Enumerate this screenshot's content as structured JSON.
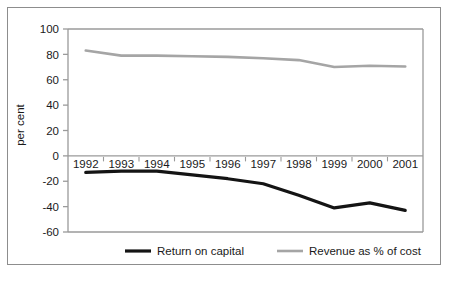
{
  "figure": {
    "ylabel": "per cent",
    "frame_color": "#8d8d8d",
    "background": "#ffffff"
  },
  "legend": {
    "items": [
      {
        "label": "Return on capital",
        "color": "#141414",
        "width": 3.2
      },
      {
        "label": "Revenue as % of cost",
        "color": "#a5a5a5",
        "width": 2.6
      }
    ]
  },
  "chart_data": {
    "type": "line",
    "title": "",
    "xlabel": "",
    "ylabel": "per cent",
    "categories": [
      "1992",
      "1993",
      "1994",
      "1995",
      "1996",
      "1997",
      "1998",
      "1999",
      "2000",
      "2001"
    ],
    "x": [
      1992,
      1993,
      1994,
      1995,
      1996,
      1997,
      1998,
      1999,
      2000,
      2001
    ],
    "ylim": [
      -60,
      100
    ],
    "yticks": [
      100,
      80,
      60,
      40,
      20,
      0,
      -20,
      -40,
      -60
    ],
    "ytick_labels": [
      "100",
      "80",
      "60",
      "40",
      "20",
      "0",
      "-20",
      "-40",
      "-60"
    ],
    "grid": false,
    "legend_position": "bottom",
    "series": [
      {
        "name": "Return on capital",
        "color": "#141414",
        "values": [
          -13,
          -12,
          -12,
          -15,
          -18,
          -22,
          -31,
          -41,
          -37,
          -43
        ]
      },
      {
        "name": "Revenue as % of cost",
        "color": "#a5a5a5",
        "values": [
          83,
          79,
          79,
          78.5,
          78,
          77,
          75.5,
          70,
          71,
          70.5
        ]
      }
    ]
  }
}
